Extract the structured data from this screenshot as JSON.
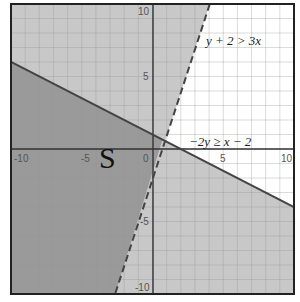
{
  "chart_data": {
    "type": "inequality-graph",
    "title": "",
    "xlim": [
      -10,
      10
    ],
    "ylim": [
      -10,
      10
    ],
    "grid": true,
    "grid_step": 1,
    "x_ticks": [
      -10,
      -5,
      0,
      5,
      10
    ],
    "y_ticks": [
      10,
      5,
      -5,
      -10
    ],
    "tick_labels": {
      "x": [
        "-10",
        "-5",
        "0",
        "5",
        "10"
      ],
      "y": [
        "10",
        "5",
        "-5",
        "-10"
      ]
    },
    "inequalities": [
      {
        "label": "y + 2 > 3x",
        "boundary": "y = 3x - 2",
        "slope": 3,
        "intercept": -2,
        "line_style": "dashed",
        "shaded_side": "above-left"
      },
      {
        "label": "−2y ≥ x − 2",
        "boundary": "y = -x/2 + 1",
        "slope": -0.5,
        "intercept": 1,
        "line_style": "solid",
        "shaded_side": "below"
      }
    ],
    "solution_region_label": "S",
    "colors": {
      "single_shade": "#c8c8c8",
      "overlap_shade": "#9a9a9a",
      "unshaded": "#ffffff",
      "grid": "#b0b0b0",
      "axis": "#333333",
      "boundary_line": "#444444"
    }
  },
  "labels": {
    "ineq1": "y + 2 > 3x",
    "ineq2": "−2y ≥ x − 2",
    "region": "S",
    "x_m10": "-10",
    "x_m5": "-5",
    "x_0": "0",
    "x_5": "5",
    "x_10": "10",
    "y_10": "10",
    "y_5": "5",
    "y_m5": "-5",
    "y_m10": "-10"
  }
}
